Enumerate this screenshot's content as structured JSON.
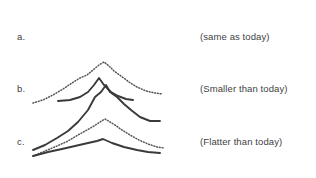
{
  "figure": {
    "background_color": "#ffffff",
    "solid_line_color": "#3a3a3a",
    "dotted_line_color": "#555555",
    "rows": [
      {
        "label": "a.",
        "caption": "(same as today)",
        "has_reference_curve": false,
        "solid_curve_name": "curve-a-solid",
        "solid_path": "M33,150 L45,145 L57,138 L68,131 L78,122 L88,110 L95,97 L101,92 L106,85 L110,92 L117,97 L124,104 L131,110 L140,117 L150,121 L160,121",
        "dotted_path": ""
      },
      {
        "label": "b.",
        "caption": "(Smaller than today)",
        "has_reference_curve": true,
        "solid_curve_name": "curve-b-solid",
        "solid_path": "M58,101 L70,100 L80,97 L88,92 L94,85 L99,78 L104,85 L111,92 L118,96 L126,99 L133,100",
        "dotted_path": "M33,103 L43,100 L53,95 L63,89 L72,83 L80,78 L87,75 L93,70 L99,65 L104,62 L109,66 L114,71 L121,76 L129,82 L137,87 L146,91 L155,93 L162,94"
      },
      {
        "label": "c.",
        "caption": "(Flatter than today)",
        "has_reference_curve": true,
        "solid_curve_name": "curve-c-solid",
        "solid_path": "M33,156 L48,152 L62,149 L75,146 L88,143 L97,141 L103,139 L112,143 L124,147 L137,150 L148,152 L160,153",
        "dotted_path": "M33,156 L45,151 L57,146 L68,141 L78,135 L87,130 L94,126 L100,122 L105,119 L110,122 L115,125 L122,130 L130,135 L139,140 L148,144 L157,147 L164,148"
      }
    ]
  }
}
